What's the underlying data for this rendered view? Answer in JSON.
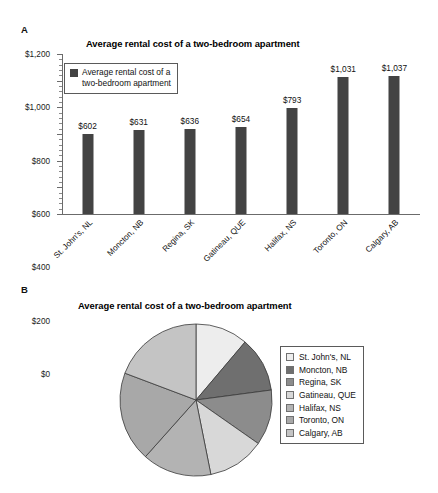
{
  "panels": {
    "a_letter": "A",
    "b_letter": "B"
  },
  "bar_legend": {
    "line1": "Average rental cost of a",
    "line2": "two-bedroom apartment",
    "swatch_color": "#434343"
  },
  "chart_data": [
    {
      "type": "bar",
      "title": "Average rental cost of a two-bedroom apartment",
      "xlabel": "",
      "ylabel": "",
      "ylim": [
        0,
        1200
      ],
      "ytick_values": [
        0,
        200,
        400,
        600,
        800,
        1000,
        1200
      ],
      "ytick_labels": [
        "$0",
        "$200",
        "$400",
        "$600",
        "$800",
        "$1,000",
        "$1,200"
      ],
      "grid": false,
      "legend_position": "upper-left-inside",
      "series_name": "Average rental cost of a two-bedroom apartment",
      "bar_color": "#434343",
      "categories": [
        "St. John's, NL",
        "Moncton, NB",
        "Regina, SK",
        "Gatineau, QUE",
        "Halifax, NS",
        "Toronto, ON",
        "Calgary, AB"
      ],
      "values": [
        602,
        631,
        636,
        654,
        793,
        1031,
        1037
      ],
      "data_labels": [
        "$602",
        "$631",
        "$636",
        "$654",
        "$793",
        "$1,031",
        "$1,037"
      ]
    },
    {
      "type": "pie",
      "title": "Average rental cost of a two-bedroom apartment",
      "legend_position": "right",
      "start_angle_deg": 0,
      "direction": "clockwise",
      "categories": [
        "St. John's, NL",
        "Moncton, NB",
        "Regina, SK",
        "Gatineau, QUE",
        "Halifax, NS",
        "Toronto, ON",
        "Calgary, AB"
      ],
      "values": [
        602,
        631,
        636,
        654,
        793,
        1031,
        1037
      ],
      "percentages": [
        11.5,
        12.0,
        12.1,
        12.5,
        15.1,
        19.6,
        19.7
      ],
      "colors": [
        "#ededed",
        "#6f6f6f",
        "#8c8c8c",
        "#d8d8d8",
        "#b3b3b3",
        "#a8a8a8",
        "#c4c4c4"
      ]
    }
  ]
}
